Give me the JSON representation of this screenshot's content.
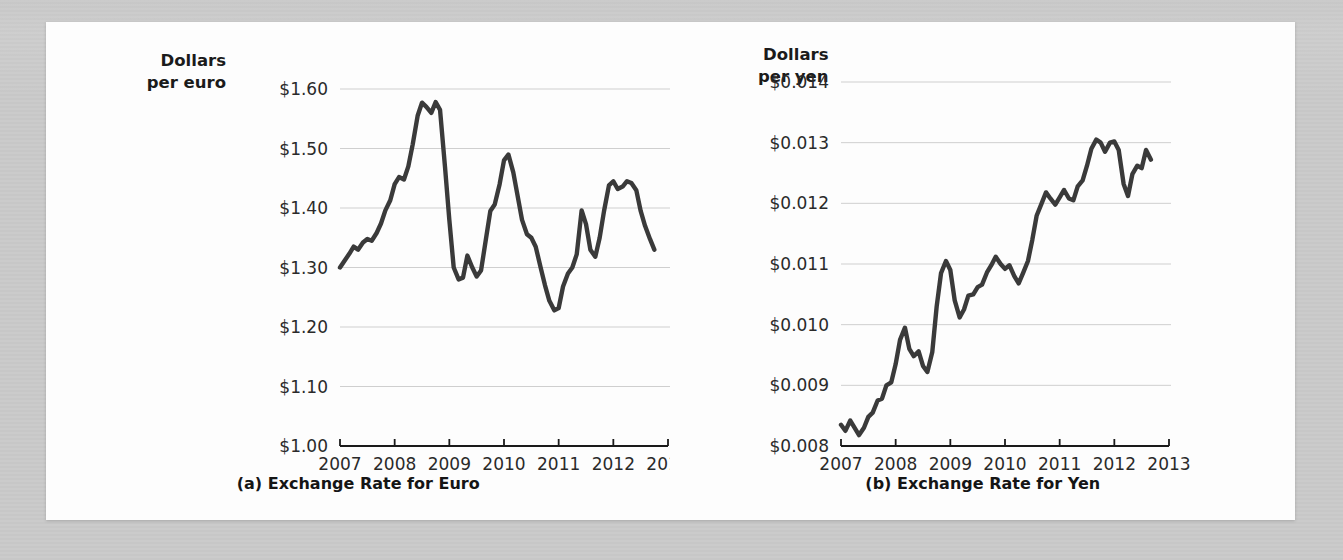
{
  "figure": {
    "background_color": "#c9c9c9",
    "card_color": "#fdfdfd",
    "line_color": "#3a3a3a",
    "grid_color": "#cfcfcf"
  },
  "panel_a": {
    "axis_title": "Dollars\nper euro",
    "caption": "(a) Exchange Rate for Euro"
  },
  "panel_b": {
    "axis_title": "Dollars\nper yen",
    "caption": "(b) Exchange Rate for Yen"
  },
  "chart_data": [
    {
      "type": "line",
      "title": "(a) Exchange Rate for Euro",
      "xlabel": "",
      "ylabel": "Dollars per euro",
      "xlim": [
        2007,
        2013
      ],
      "ylim": [
        1.0,
        1.6
      ],
      "grid": true,
      "legend": "none",
      "ytick_labels": [
        "$1.00",
        "$1.10",
        "$1.20",
        "$1.30",
        "$1.40",
        "$1.50",
        "$1.60"
      ],
      "ytick_values": [
        1.0,
        1.1,
        1.2,
        1.3,
        1.4,
        1.5,
        1.6
      ],
      "xtick_labels": [
        "2007",
        "2008",
        "2009",
        "2010",
        "2011",
        "2012",
        "2013"
      ],
      "xtick_values": [
        2007,
        2008,
        2009,
        2010,
        2011,
        2012,
        2013
      ],
      "series": [
        {
          "name": "Dollars per euro",
          "x": [
            2007.0,
            2007.08,
            2007.17,
            2007.25,
            2007.33,
            2007.42,
            2007.5,
            2007.58,
            2007.67,
            2007.75,
            2007.83,
            2007.92,
            2008.0,
            2008.08,
            2008.17,
            2008.25,
            2008.33,
            2008.42,
            2008.5,
            2008.58,
            2008.67,
            2008.75,
            2008.83,
            2008.92,
            2009.0,
            2009.08,
            2009.17,
            2009.25,
            2009.33,
            2009.42,
            2009.5,
            2009.58,
            2009.67,
            2009.75,
            2009.83,
            2009.92,
            2010.0,
            2010.08,
            2010.17,
            2010.25,
            2010.33,
            2010.42,
            2010.5,
            2010.58,
            2010.67,
            2010.75,
            2010.83,
            2010.92,
            2011.0,
            2011.08,
            2011.17,
            2011.25,
            2011.33,
            2011.42,
            2011.5,
            2011.58,
            2011.67,
            2011.75,
            2011.83,
            2011.92,
            2012.0,
            2012.08,
            2012.17,
            2012.25,
            2012.33,
            2012.42,
            2012.5,
            2012.58,
            2012.67,
            2012.75
          ],
          "values": [
            1.3,
            1.311,
            1.323,
            1.335,
            1.33,
            1.342,
            1.348,
            1.345,
            1.358,
            1.374,
            1.396,
            1.413,
            1.44,
            1.452,
            1.448,
            1.47,
            1.507,
            1.555,
            1.577,
            1.57,
            1.56,
            1.578,
            1.565,
            1.47,
            1.38,
            1.3,
            1.28,
            1.283,
            1.32,
            1.3,
            1.285,
            1.295,
            1.348,
            1.395,
            1.406,
            1.44,
            1.48,
            1.49,
            1.46,
            1.42,
            1.38,
            1.356,
            1.35,
            1.335,
            1.3,
            1.27,
            1.244,
            1.228,
            1.232,
            1.268,
            1.29,
            1.3,
            1.322,
            1.396,
            1.373,
            1.33,
            1.318,
            1.35,
            1.395,
            1.438,
            1.445,
            1.432,
            1.436,
            1.445,
            1.442,
            1.43,
            1.395,
            1.37,
            1.348,
            1.33
          ]
        }
      ]
    },
    {
      "type": "line",
      "title": "(b) Exchange Rate for Yen",
      "xlabel": "",
      "ylabel": "Dollars per yen",
      "xlim": [
        2007,
        2013
      ],
      "ylim": [
        0.008,
        0.014
      ],
      "grid": true,
      "legend": "none",
      "ytick_labels": [
        "$0.008",
        "$0.009",
        "$0.010",
        "$0.011",
        "$0.012",
        "$0.013",
        "$0.014"
      ],
      "ytick_values": [
        0.008,
        0.009,
        0.01,
        0.011,
        0.012,
        0.013,
        0.014
      ],
      "xtick_labels": [
        "2007",
        "2008",
        "2009",
        "2010",
        "2011",
        "2012",
        "2013"
      ],
      "xtick_values": [
        2007,
        2008,
        2009,
        2010,
        2011,
        2012,
        2013
      ],
      "series": [
        {
          "name": "Dollars per yen",
          "x": [
            2007.0,
            2007.08,
            2007.17,
            2007.25,
            2007.33,
            2007.42,
            2007.5,
            2007.58,
            2007.67,
            2007.75,
            2007.83,
            2007.92,
            2008.0,
            2008.08,
            2008.17,
            2008.25,
            2008.33,
            2008.42,
            2008.5,
            2008.58,
            2008.67,
            2008.75,
            2008.83,
            2008.92,
            2009.0,
            2009.08,
            2009.17,
            2009.25,
            2009.33,
            2009.42,
            2009.5,
            2009.58,
            2009.67,
            2009.75,
            2009.83,
            2009.92,
            2010.0,
            2010.08,
            2010.17,
            2010.25,
            2010.33,
            2010.42,
            2010.5,
            2010.58,
            2010.67,
            2010.75,
            2010.83,
            2010.92,
            2011.0,
            2011.08,
            2011.17,
            2011.25,
            2011.33,
            2011.42,
            2011.5,
            2011.58,
            2011.67,
            2011.75,
            2011.83,
            2011.92,
            2012.0,
            2012.08,
            2012.17,
            2012.25,
            2012.33,
            2012.42,
            2012.5,
            2012.58,
            2012.67
          ],
          "values": [
            0.00835,
            0.00825,
            0.00842,
            0.0083,
            0.00818,
            0.0083,
            0.00848,
            0.00855,
            0.00875,
            0.00878,
            0.009,
            0.00905,
            0.00935,
            0.00975,
            0.00995,
            0.0096,
            0.00948,
            0.00956,
            0.00932,
            0.00922,
            0.00955,
            0.0103,
            0.01085,
            0.01105,
            0.0109,
            0.0104,
            0.01012,
            0.01025,
            0.01048,
            0.0105,
            0.01062,
            0.01066,
            0.01086,
            0.01098,
            0.01112,
            0.011,
            0.01092,
            0.01098,
            0.0108,
            0.01068,
            0.01085,
            0.01105,
            0.0114,
            0.0118,
            0.012,
            0.01218,
            0.01208,
            0.01198,
            0.0121,
            0.01222,
            0.01208,
            0.01205,
            0.01228,
            0.01238,
            0.01262,
            0.0129,
            0.01305,
            0.013,
            0.01285,
            0.013,
            0.01302,
            0.01288,
            0.01232,
            0.01212,
            0.01248,
            0.01262,
            0.01258,
            0.01288,
            0.01272
          ]
        }
      ]
    }
  ]
}
